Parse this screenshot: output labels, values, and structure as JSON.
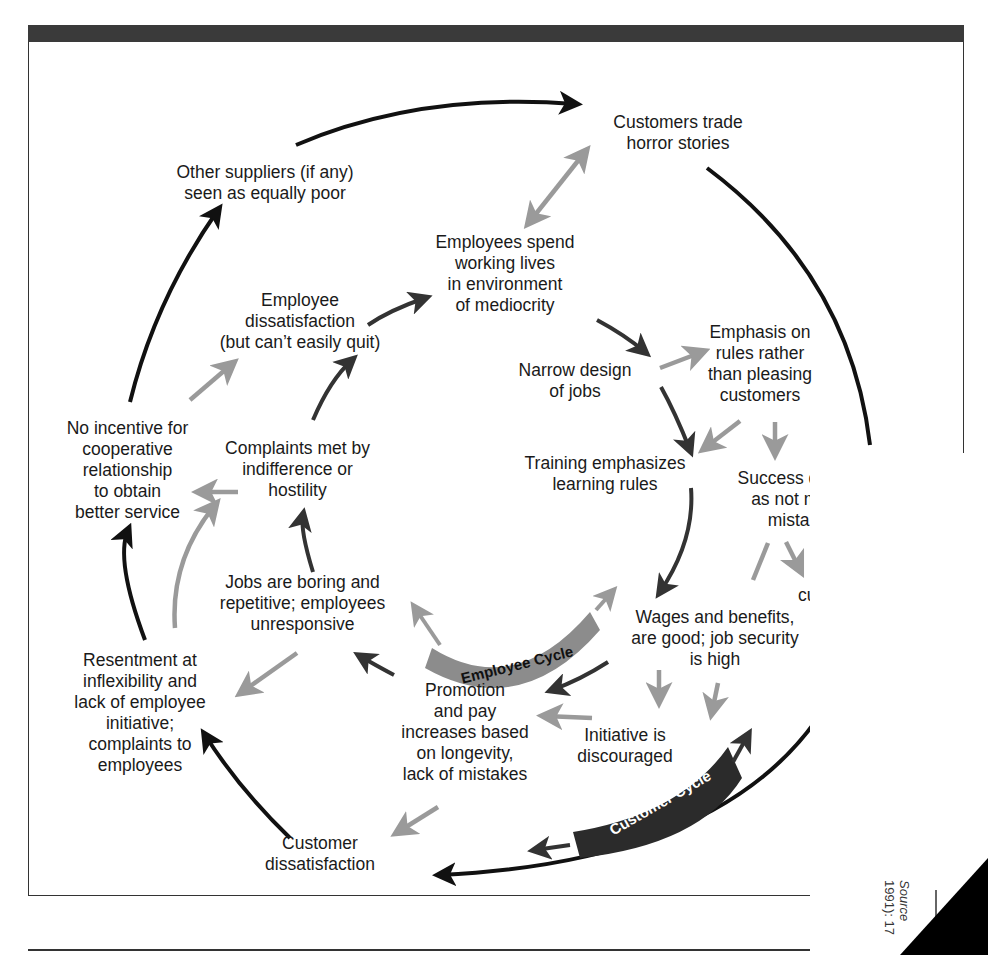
{
  "figure": {
    "nodes": {
      "customers_trade": "Customers trade\nhorror stories",
      "other_suppliers": "Other suppliers (if any)\nseen as equally poor",
      "employees_spend": "Employees spend\nworking lives\nin environment\nof mediocrity",
      "employee_dissatisfaction": "Employee\ndissatisfaction\n(but can’t easily quit)",
      "emphasis_rules": "Emphasis on\nrules rather\nthan pleasing\ncustomers",
      "narrow_design": "Narrow design\nof jobs",
      "no_incentive": "No incentive for\ncooperative\nrelationship\nto obtain\nbetter service",
      "complaints_met": "Complaints met by\nindifference or\nhostility",
      "training": "Training emphasizes\nlearning rules",
      "success_defined": "Success de\nas not ma\nmistake",
      "cu_fragment": "cu",
      "jobs_boring": "Jobs are boring and\nrepetitive; employees\nunresponsive",
      "wages": "Wages and benefits,\nare good; job security\nis high",
      "resentment": "Resentment at\ninflexibility and\nlack of employee\ninitiative;\ncomplaints to\nemployees",
      "promotion": "Promotion\nand pay\nincreases based\non longevity,\nlack of mistakes",
      "initiative": "Initiative is\ndiscouraged",
      "customer_dissatisfaction": "Customer\ndissatisfaction"
    },
    "labels": {
      "employee_cycle": "Employee Cycle",
      "customer_cycle": "Customer Cycle"
    },
    "source_note": {
      "line1": "Source",
      "line2": "1991): 17"
    },
    "colors": {
      "header_bar": "#3a3a3a",
      "black_arrow": "#111111",
      "dark_arrow": "#333333",
      "gray_arrow": "#9a9a9a",
      "employee_banner": "#8c8c8c",
      "customer_banner": "#2b2b2b"
    }
  }
}
